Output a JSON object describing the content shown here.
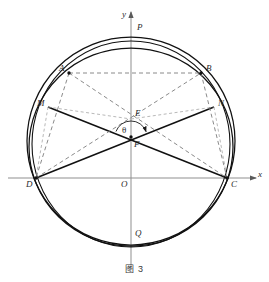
{
  "figure": {
    "caption": "图 3",
    "kind": "geometry-diagram",
    "colors": {
      "stroke": "#1a1a1a",
      "axis": "#8a8a8a",
      "dashed": "#8a8a8a",
      "label": "#2b2b2b",
      "background": "#ffffff"
    }
  },
  "axes": {
    "x_label": "x",
    "y_label": "y",
    "origin_label": "O",
    "origin": {
      "x": 131,
      "y": 178
    },
    "x_axis": {
      "x1": 8,
      "y1": 178,
      "x2": 256,
      "y2": 178
    },
    "y_axis": {
      "x1": 131,
      "y1": 270,
      "x2": 131,
      "y2": 12
    }
  },
  "curves": {
    "circle": {
      "cx": 131,
      "cy": 141,
      "r": 104
    },
    "ellipse": {
      "cx": 131,
      "cy": 147,
      "rx": 102,
      "ry": 99,
      "rotate": 0
    },
    "ellipse2": {
      "cx": 131,
      "cy": 144,
      "rx": 99,
      "ry": 103,
      "rotate": 0
    }
  },
  "points": [
    {
      "name": "P",
      "x": 131,
      "y": 32,
      "label": "P",
      "label_dx": 6,
      "label_dy": -9,
      "dot": false
    },
    {
      "name": "A",
      "x": 69,
      "y": 73,
      "label": "A",
      "label_dx": -10,
      "label_dy": -9,
      "dot": true
    },
    {
      "name": "B",
      "x": 201,
      "y": 73,
      "label": "B",
      "label_dx": 5,
      "label_dy": -9,
      "dot": true
    },
    {
      "name": "M",
      "x": 48,
      "y": 107,
      "label": "M",
      "label_dx": -11,
      "label_dy": -8,
      "dot": false
    },
    {
      "name": "N",
      "x": 214,
      "y": 107,
      "label": "N",
      "label_dx": 4,
      "label_dy": -8,
      "dot": false
    },
    {
      "name": "E",
      "x": 131,
      "y": 119,
      "label": "E",
      "label_dx": 4,
      "label_dy": -10,
      "dot": false
    },
    {
      "name": "F",
      "x": 131,
      "y": 137,
      "label": "F",
      "label_dx": 3,
      "label_dy": 3,
      "dot": true
    },
    {
      "name": "D",
      "x": 36,
      "y": 178,
      "label": "D",
      "label_dx": -10,
      "label_dy": 2,
      "dot": true
    },
    {
      "name": "C",
      "x": 227,
      "y": 178,
      "label": "C",
      "label_dx": 4,
      "label_dy": 2,
      "dot": true
    },
    {
      "name": "Q",
      "x": 131,
      "y": 228,
      "label": "Q",
      "label_dx": 4,
      "label_dy": 1,
      "dot": false
    }
  ],
  "angle": {
    "symbol": "θ",
    "vertex": "F",
    "label_x": 122,
    "label_y": 126,
    "arc_radius": 16
  },
  "segments": [
    {
      "name": "segment-MC",
      "from": "M",
      "to": "C",
      "style": "solid"
    },
    {
      "name": "segment-DN",
      "from": "D",
      "to": "N",
      "style": "solid"
    },
    {
      "name": "segment-AB",
      "from": "A",
      "to": "B",
      "style": "dashed"
    },
    {
      "name": "segment-AC",
      "from": "A",
      "to": "C",
      "style": "dashed"
    },
    {
      "name": "segment-DB",
      "from": "D",
      "to": "B",
      "style": "dashed"
    },
    {
      "name": "segment-AD",
      "from": "A",
      "to": "D",
      "style": "dashed"
    },
    {
      "name": "segment-BC",
      "from": "B",
      "to": "C",
      "style": "dashed"
    },
    {
      "name": "segment-ME",
      "from": "M",
      "to": "E",
      "style": "dashed-thin"
    },
    {
      "name": "segment-EN",
      "from": "E",
      "to": "N",
      "style": "dashed-thin"
    },
    {
      "name": "segment-MD",
      "from": "M",
      "to": "D",
      "style": "dashed-thin"
    },
    {
      "name": "segment-NC",
      "from": "N",
      "to": "C",
      "style": "dashed-thin"
    }
  ]
}
